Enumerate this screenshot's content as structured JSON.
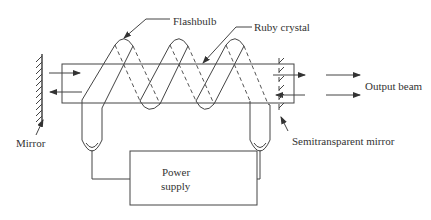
{
  "diagram": {
    "type": "ruby-laser-schematic",
    "labels": {
      "flashbulb": "Flashbulb",
      "ruby_crystal": "Ruby crystal",
      "output_beam": "Output beam",
      "mirror": "Mirror",
      "semitransparent_mirror": "Semitransparent mirror",
      "power_supply_line1": "Power",
      "power_supply_line2": "supply"
    },
    "components": [
      "mirror",
      "ruby-crystal",
      "flashbulb-coil",
      "semitransparent-mirror",
      "power-supply",
      "output-beam"
    ],
    "colors": {
      "line": "#444444",
      "text": "#333333",
      "background": "#ffffff"
    }
  }
}
